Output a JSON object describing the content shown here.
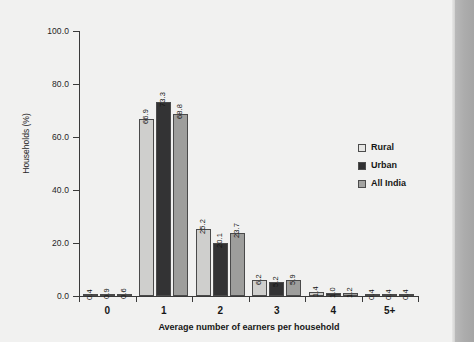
{
  "chart_data": {
    "type": "bar",
    "title": "",
    "xlabel": "Average number of earners per household",
    "ylabel": "Households (%)",
    "categories": [
      "0",
      "1",
      "2",
      "3",
      "4",
      "5+"
    ],
    "series": [
      {
        "name": "Rural",
        "color": "#cfcfcd",
        "values": [
          0.4,
          66.9,
          25.2,
          6.2,
          1.4,
          0.4
        ]
      },
      {
        "name": "Urban",
        "color": "#333334",
        "values": [
          0.9,
          73.3,
          20.1,
          5.2,
          1.0,
          0.4
        ]
      },
      {
        "name": "All India",
        "color": "#9e9e9c",
        "values": [
          0.6,
          68.8,
          23.7,
          5.9,
          1.2,
          0.4
        ]
      }
    ],
    "ylim": [
      0,
      100
    ],
    "yticks": [
      0.0,
      20.0,
      40.0,
      60.0,
      80.0,
      100.0
    ],
    "ytick_labels": [
      "0.0",
      "20.0",
      "40.0",
      "60.0",
      "80.0",
      "100.0"
    ],
    "grid": false,
    "legend_position": "right",
    "value_labels_rotated": true,
    "value_label_format": "one-decimal"
  },
  "axes": {
    "y_title": "Households (%)",
    "x_title": "Average number of earners per household"
  },
  "legend": {
    "items": [
      {
        "label": "Rural",
        "swatch": "legend-swatch-rural"
      },
      {
        "label": "Urban",
        "swatch": "legend-swatch-urban"
      },
      {
        "label": "All India",
        "swatch": "legend-swatch-all-india"
      }
    ]
  }
}
